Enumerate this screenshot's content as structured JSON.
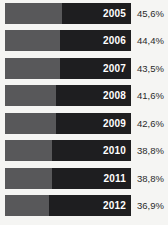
{
  "chart_data": {
    "type": "bar",
    "title": "",
    "subtitle": "",
    "xlabel": "",
    "ylabel": "",
    "orientation": "horizontal",
    "stacked": true,
    "grid": false,
    "legend": "none",
    "categories": [
      "2005",
      "2006",
      "2007",
      "2008",
      "2009",
      "2010",
      "2011",
      "2012"
    ],
    "values": [
      45.6,
      44.4,
      43.5,
      41.6,
      42.6,
      38.8,
      38.8,
      36.9
    ],
    "value_labels": [
      "45,6%",
      "44,4%",
      "43,5%",
      "41,6%",
      "42,6%",
      "38,8%",
      "38,8%",
      "36,9%"
    ],
    "series": [
      {
        "name": "light-segment",
        "color": "#58585a",
        "fractions": [
          0.452,
          0.433,
          0.433,
          0.405,
          0.405,
          0.373,
          0.373,
          0.349
        ]
      },
      {
        "name": "dark-segment",
        "color": "#1e1e20",
        "fractions": [
          0.548,
          0.567,
          0.567,
          0.595,
          0.595,
          0.627,
          0.627,
          0.651
        ]
      }
    ],
    "ylim": [
      0,
      100
    ]
  },
  "rows": [
    {
      "year": "2005",
      "value_label": "45,6%",
      "light_pct": 45.2
    },
    {
      "year": "2006",
      "value_label": "44,4%",
      "light_pct": 43.3
    },
    {
      "year": "2007",
      "value_label": "43,5%",
      "light_pct": 43.3
    },
    {
      "year": "2008",
      "value_label": "41,6%",
      "light_pct": 40.5
    },
    {
      "year": "2009",
      "value_label": "42,6%",
      "light_pct": 40.5
    },
    {
      "year": "2010",
      "value_label": "38,8%",
      "light_pct": 37.3
    },
    {
      "year": "2011",
      "value_label": "38,8%",
      "light_pct": 37.3
    },
    {
      "year": "2012",
      "value_label": "36,9%",
      "light_pct": 34.9
    }
  ],
  "colors": {
    "background": "#f5f5f3",
    "bar_light": "#58585a",
    "bar_dark": "#1e1e20",
    "year_label": "#ffffff",
    "value_label": "#2a2a2a"
  },
  "layout": {
    "row_top_start": 2,
    "row_pitch": 27.5
  }
}
